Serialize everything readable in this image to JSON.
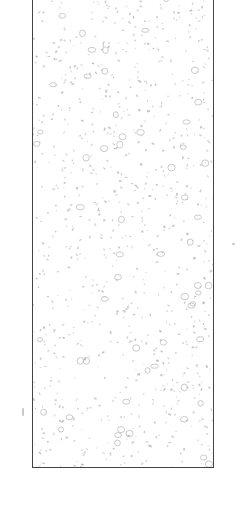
{
  "image": {
    "subject": "speckled texture swatch",
    "background_color": "#ffffff",
    "frame_color": "#444444",
    "speckle_color": "#b8b8b8",
    "speckle_outline_color": "#c4c4c4",
    "frame": {
      "x": 32,
      "y": -2,
      "width": 182,
      "height": 470
    }
  }
}
